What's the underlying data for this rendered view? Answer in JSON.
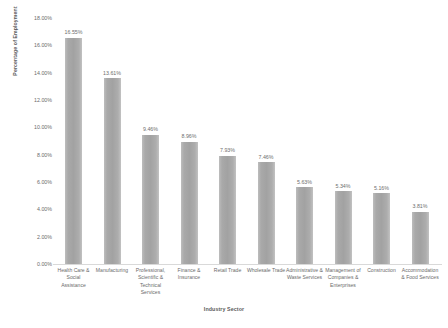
{
  "chart_data": {
    "type": "bar",
    "title": "",
    "xlabel": "Industry Sector",
    "ylabel": "Percentage of Employment",
    "ylim": [
      0,
      18
    ],
    "ytick_labels": [
      "18.00%",
      "16.00%",
      "14.00%",
      "12.00%",
      "10.00%",
      "8.00%",
      "6.00%",
      "4.00%",
      "2.00%",
      "0.00%"
    ],
    "ytick_values": [
      18,
      16,
      14,
      12,
      10,
      8,
      6,
      4,
      2,
      0
    ],
    "grid": false,
    "legend": "none",
    "bar_color": "#a5a5a5",
    "categories": [
      "Health Care & Social Assistance",
      "Manufacturing",
      "Professional, Scientific & Technical Services",
      "Finance & Insurance",
      "Retail Trade",
      "Wholesale Trade",
      "Administrative & Waste Services",
      "Management of Companies & Enterprises",
      "Construction",
      "Accommodation & Food Services"
    ],
    "values": [
      16.55,
      13.61,
      9.46,
      8.96,
      7.93,
      7.46,
      5.63,
      5.34,
      5.16,
      3.81
    ],
    "value_labels": [
      "16.55%",
      "13.61%",
      "9.46%",
      "8.96%",
      "7.93%",
      "7.46%",
      "5.63%",
      "5.34%",
      "5.16%",
      "3.81%"
    ]
  }
}
